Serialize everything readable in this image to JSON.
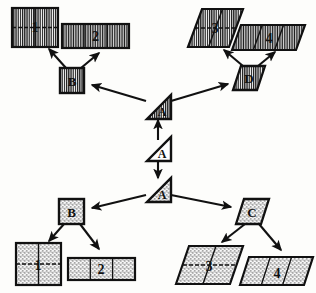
{
  "figure": {
    "kind": "tree-diagram",
    "background_color": "#fdfdfb",
    "ink_color": "#111111"
  },
  "patterns": {
    "hatch": {
      "name": "vertical-hatch",
      "color": "#1a1a1a"
    },
    "stipple": {
      "name": "stipple-dots",
      "color": "#2a2a2a"
    },
    "plain": {
      "name": "no-fill",
      "color": "#ffffff"
    }
  },
  "nodes": {
    "root": {
      "id": "root",
      "label": "A",
      "shape": "triangle",
      "fill": "plain",
      "x": 158,
      "y": 148
    },
    "upper_a": {
      "id": "upper-a",
      "label": "A",
      "shape": "triangle",
      "fill": "hatch",
      "x": 158,
      "y": 106
    },
    "lower_a": {
      "id": "lower-a",
      "label": "A",
      "shape": "triangle",
      "fill": "stipple",
      "x": 158,
      "y": 189
    },
    "b_top": {
      "id": "b-top",
      "label": "B",
      "shape": "square",
      "fill": "hatch",
      "x": 72,
      "y": 81
    },
    "d_top": {
      "id": "d-top",
      "label": "D",
      "shape": "parallelogram",
      "fill": "hatch",
      "x": 248,
      "y": 78
    },
    "b_bottom": {
      "id": "b-bottom",
      "label": "B",
      "shape": "square",
      "fill": "stipple",
      "x": 71,
      "y": 211
    },
    "c_bottom": {
      "id": "c-bottom",
      "label": "C",
      "shape": "parallelogram",
      "fill": "stipple",
      "x": 252,
      "y": 211
    }
  },
  "leaves": [
    {
      "id": "leaf-hatch-1",
      "label": "1",
      "shape": "square",
      "fill": "hatch",
      "divisions": 4,
      "grid": "2x2",
      "x": 35,
      "y": 27
    },
    {
      "id": "leaf-hatch-2",
      "label": "2",
      "shape": "rectangle",
      "fill": "hatch",
      "divisions": 3,
      "grid": "1x3",
      "x": 95,
      "y": 36
    },
    {
      "id": "leaf-hatch-3",
      "label": "3",
      "shape": "parallelogram",
      "fill": "hatch",
      "divisions": 4,
      "grid": "2x2",
      "x": 206,
      "y": 28
    },
    {
      "id": "leaf-hatch-4",
      "label": "4",
      "shape": "parallelogram",
      "fill": "hatch",
      "divisions": 3,
      "grid": "1x3",
      "x": 268,
      "y": 37
    },
    {
      "id": "leaf-stipple-1",
      "label": "1",
      "shape": "square",
      "fill": "stipple",
      "divisions": 4,
      "grid": "2x2",
      "x": 38,
      "y": 264
    },
    {
      "id": "leaf-stipple-2",
      "label": "2",
      "shape": "rectangle",
      "fill": "stipple",
      "divisions": 3,
      "grid": "1x3",
      "x": 101,
      "y": 268
    },
    {
      "id": "leaf-stipple-3",
      "label": "3",
      "shape": "parallelogram",
      "fill": "stipple",
      "divisions": 4,
      "grid": "2x2",
      "x": 210,
      "y": 263
    },
    {
      "id": "leaf-stipple-4",
      "label": "4",
      "shape": "parallelogram",
      "fill": "stipple",
      "divisions": 3,
      "grid": "1x3",
      "x": 277,
      "y": 270
    }
  ],
  "edges": [
    {
      "from": "root",
      "to": "upper_a",
      "direction": "up"
    },
    {
      "from": "root",
      "to": "lower_a",
      "direction": "down"
    },
    {
      "from": "upper_a",
      "to": "b_top",
      "direction": "up-left"
    },
    {
      "from": "upper_a",
      "to": "d_top",
      "direction": "up-right"
    },
    {
      "from": "b_top",
      "to": "leaf-hatch-1",
      "direction": "up-left"
    },
    {
      "from": "b_top",
      "to": "leaf-hatch-2",
      "direction": "up-right"
    },
    {
      "from": "d_top",
      "to": "leaf-hatch-3",
      "direction": "up-left"
    },
    {
      "from": "d_top",
      "to": "leaf-hatch-4",
      "direction": "up-right"
    },
    {
      "from": "lower_a",
      "to": "b_bottom",
      "direction": "down-left"
    },
    {
      "from": "lower_a",
      "to": "c_bottom",
      "direction": "down-right"
    },
    {
      "from": "b_bottom",
      "to": "leaf-stipple-1",
      "direction": "down-left"
    },
    {
      "from": "b_bottom",
      "to": "leaf-stipple-2",
      "direction": "down-right"
    },
    {
      "from": "c_bottom",
      "to": "leaf-stipple-3",
      "direction": "down-left"
    },
    {
      "from": "c_bottom",
      "to": "leaf-stipple-4",
      "direction": "down-right"
    }
  ]
}
